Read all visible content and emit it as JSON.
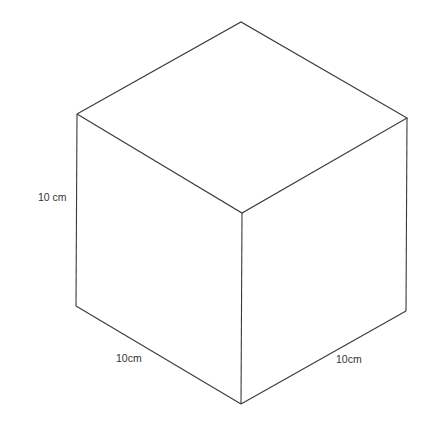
{
  "figure": {
    "type": "isometric cube",
    "labels": {
      "height": "10 cm",
      "left_depth": "10cm",
      "right_width": "10cm"
    },
    "colors": {
      "edge": "#3a3a3a",
      "background": "#ffffff"
    }
  }
}
